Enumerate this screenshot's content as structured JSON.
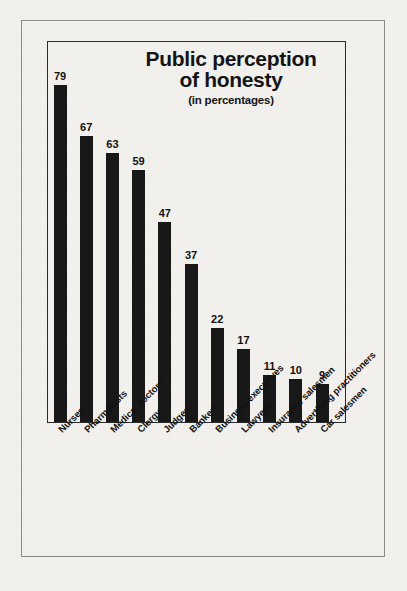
{
  "chart_data": {
    "type": "bar",
    "title": "Public perception\nof honesty",
    "subtitle": "(in percentages)",
    "xlabel": "",
    "ylabel": "",
    "ylim": [
      0,
      90
    ],
    "grid": false,
    "legend": "none",
    "orientation": "vertical",
    "bar_color": "#181818",
    "categories": [
      "Nurses",
      "Pharmacists",
      "Medical doctors",
      "Clergy",
      "Judges",
      "Bankers",
      "Business executives",
      "Lawyers",
      "Insurance salesmen",
      "Advertising practitioners",
      "Car salesmen"
    ],
    "values": [
      79,
      67,
      63,
      59,
      47,
      37,
      22,
      17,
      11,
      10,
      9
    ],
    "value_labels": [
      "79",
      "67",
      "63",
      "59",
      "47",
      "37",
      "22",
      "17",
      "11",
      "10",
      "9"
    ]
  },
  "colors": {
    "background": "#f3f2ef",
    "outer_frame": "#8a8a8a",
    "plot_frame": "#2b2b2b",
    "bar": "#181818",
    "text": "#141414"
  }
}
